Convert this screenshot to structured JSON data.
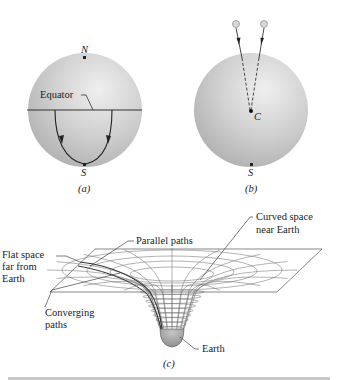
{
  "panel_a": {
    "label": "(a)",
    "north": "N",
    "south": "S",
    "equator": "Equator"
  },
  "panel_b": {
    "label": "(b)",
    "center": "C",
    "south": "S"
  },
  "panel_c": {
    "label": "(c)",
    "parallel_paths": "Parallel paths",
    "curved_space_line1": "Curved space",
    "curved_space_line2": "near Earth",
    "flat_space_line1": "Flat space",
    "flat_space_line2": "far from",
    "flat_space_line3": "Earth",
    "converging_line1": "Converging",
    "converging_line2": "paths",
    "earth": "Earth"
  },
  "colors": {
    "sphere_light": "#e8e8e8",
    "sphere_dark": "#b4b4b4",
    "earth_fill": "#a8a8a8",
    "line": "#333333"
  }
}
